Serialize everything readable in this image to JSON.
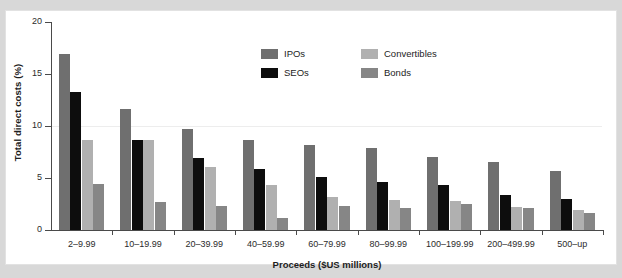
{
  "figure": {
    "background_color": "#ffffff",
    "page_background_color": "#d8d8d8"
  },
  "chart_data": {
    "type": "bar",
    "title": "",
    "xlabel": "Proceeds ($US millions)",
    "ylabel": "Total direct costs (%)",
    "ylim": [
      0,
      20
    ],
    "yticks": [
      0,
      5,
      10,
      15,
      20
    ],
    "ytick_labels": [
      "0",
      "5",
      "10",
      "15",
      "20"
    ],
    "grid": "faint horizontal line near 10%",
    "legend_position": "upper center",
    "categories": [
      "2–9.99",
      "10–19.99",
      "20–39.99",
      "40–59.99",
      "60–79.99",
      "80–99.99",
      "100–199.99",
      "200–499.99",
      "500–up"
    ],
    "series": [
      {
        "name": "IPOs",
        "color": "#6f6f6f",
        "values": [
          16.9,
          11.6,
          9.7,
          8.7,
          8.2,
          7.9,
          7.0,
          6.5,
          5.7
        ]
      },
      {
        "name": "SEOs",
        "color": "#0d0d0d",
        "values": [
          13.3,
          8.7,
          6.9,
          5.9,
          5.1,
          4.6,
          4.3,
          3.4,
          3.0
        ]
      },
      {
        "name": "Convertibles",
        "color": "#b0b0b0",
        "values": [
          8.7,
          8.7,
          6.1,
          4.3,
          3.2,
          2.9,
          2.8,
          2.2,
          1.9
        ]
      },
      {
        "name": "Bonds",
        "color": "#868686",
        "values": [
          4.4,
          2.7,
          2.3,
          1.2,
          2.3,
          2.1,
          2.5,
          2.1,
          1.6
        ]
      }
    ]
  }
}
